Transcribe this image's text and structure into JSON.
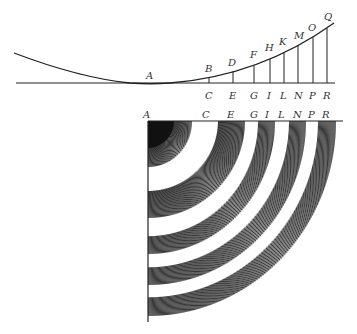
{
  "top_figure": {
    "curve_label": "A",
    "upper_points": [
      "B",
      "D",
      "F",
      "H",
      "K",
      "M",
      "O",
      "Q"
    ],
    "base_points": [
      "C",
      "E",
      "G",
      "I",
      "L",
      "N",
      "P",
      "R"
    ]
  },
  "bottom_figure": {
    "origin_label": "A",
    "axis_points": [
      "C",
      "E",
      "G",
      "I",
      "L",
      "N",
      "P",
      "R"
    ],
    "rings": 5,
    "ink_color": "#222222"
  }
}
